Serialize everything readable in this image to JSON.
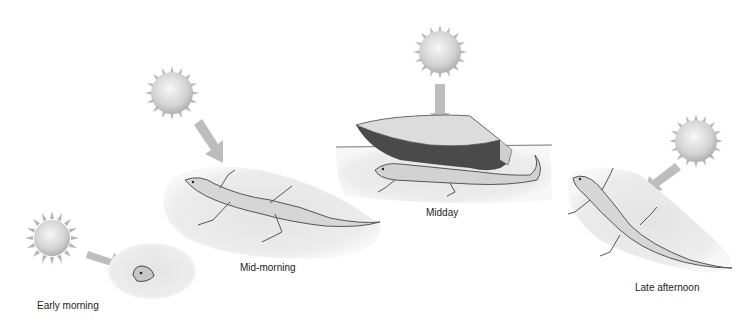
{
  "figure": {
    "colors": {
      "sun_core": "#f2f2f2",
      "sun_edge": "#b8b8b8",
      "arrow": "#bdbdbd",
      "sand": "#e6e6e6",
      "lizard_fill": "#d9d9d9",
      "lizard_stroke": "#555555",
      "rock_top": "#dcdcdc",
      "rock_side": "#4a4a4a",
      "label_text": "#222222"
    },
    "panels": [
      {
        "id": "early-morning",
        "label": "Early morning",
        "behavior": "lizard mostly buried, only head exposed"
      },
      {
        "id": "mid-morning",
        "label": "Mid-morning",
        "behavior": "lizard basking flat on sand"
      },
      {
        "id": "midday",
        "label": "Midday",
        "behavior": "lizard sheltering under rock"
      },
      {
        "id": "late-afternoon",
        "label": "Late afternoon",
        "behavior": "lizard basking, oriented toward sun"
      }
    ]
  }
}
